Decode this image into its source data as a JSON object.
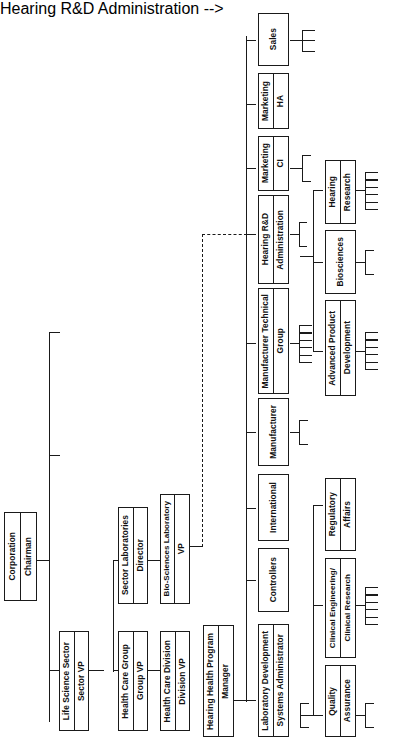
{
  "diagram": {
    "orientation": "rotated-90-ccw",
    "line_color": "#1a1a1a",
    "box_fill": "#ffffff"
  },
  "nodes": {
    "corporation": {
      "line1": "Corporation",
      "line2": "Chairman"
    },
    "life_science": {
      "line1": "Life Science Sector",
      "line2": "Sector VP"
    },
    "health_care_group": {
      "line1": "Health Care Group",
      "line2": "Group VP"
    },
    "sector_labs": {
      "line1": "Sector Laboratories",
      "line2": "Director"
    },
    "health_care_div": {
      "line1": "Health Care Division",
      "line2": "Division VP"
    },
    "biosciences_lab": {
      "line1": "Bio-Sciences Laboratory",
      "line2": "VP"
    },
    "hearing_health": {
      "line1": "Hearing Health Program",
      "line2": "Manager"
    },
    "lab_dev": {
      "line1": "Laboratory Development",
      "line2": "Systems Administrator"
    },
    "controllers": {
      "line1": "Controllers",
      "line2": ""
    },
    "international": {
      "line1": "International",
      "line2": ""
    },
    "manufacturer": {
      "line1": "Manufacturer",
      "line2": ""
    },
    "mfg_tech_group": {
      "line1": "Manufacturer Technical",
      "line2": "Group"
    },
    "hearing_rd": {
      "line1": "Hearing R&D",
      "line2": "Administration"
    },
    "marketing_ci": {
      "line1": "Marketing",
      "line2": "CI"
    },
    "marketing_ha": {
      "line1": "Marketing",
      "line2": "HA"
    },
    "sales": {
      "line1": "Sales",
      "line2": ""
    },
    "quality_assurance": {
      "line1": "Quality",
      "line2": "Assurance"
    },
    "clinical_eng": {
      "line1": "Clinical Engineering/",
      "line2": "Clinical Research"
    },
    "regulatory_affairs": {
      "line1": "Regulatory",
      "line2": "Affairs"
    },
    "advanced_product": {
      "line1": "Advanced Product",
      "line2": "Development"
    },
    "biosciences": {
      "line1": "Biosciences",
      "line2": ""
    },
    "hearing_research": {
      "line1": "Hearing",
      "line2": "Research"
    }
  },
  "leaf_groups": {
    "sales_leaves": {
      "count": 3,
      "label": "unlabeled sub-units of Sales"
    },
    "marketing_ci_leaves": {
      "count": 2,
      "label": "unlabeled sub-units of Marketing CI"
    },
    "hearing_research_leaves": {
      "count": 6,
      "label": "unlabeled sub-units of Hearing Research"
    },
    "biosciences_leaves": {
      "count": 2,
      "label": "unlabeled sub-units of Biosciences"
    },
    "advanced_product_leaves": {
      "count": 6,
      "label": "unlabeled sub-units of Advanced Product Development"
    },
    "mfg_tech_leaves": {
      "count": 6,
      "label": "unlabeled sub-units of Manufacturer Technical Group"
    },
    "manufacturer_leaves": {
      "count": 2,
      "label": "unlabeled sub-units of Manufacturer"
    },
    "hearing_rd_leaves": {
      "count": 2,
      "label": "unlabeled sub-units of Hearing R&D Administration"
    },
    "clinical_eng_leaves": {
      "count": 6,
      "label": "unlabeled sub-units of Clinical Engineering / Clinical Research"
    },
    "quality_assurance_leaves": {
      "count": 2,
      "label": "unlabeled sub-units of Quality Assurance"
    },
    "lab_dev_leaves": {
      "count": 2,
      "label": "unlabeled sub-units of Laboratory Development"
    }
  },
  "hierarchy": {
    "root": "corporation",
    "edges": [
      {
        "parent": "corporation",
        "child": "life_science"
      },
      {
        "parent": "life_science",
        "child": "health_care_group"
      },
      {
        "parent": "health_care_group",
        "child": "sector_labs"
      },
      {
        "parent": "health_care_group",
        "child": "health_care_div"
      },
      {
        "parent": "sector_labs",
        "child": "biosciences_lab"
      },
      {
        "parent": "health_care_div",
        "child": "hearing_health"
      },
      {
        "parent": "hearing_health",
        "child": "lab_dev"
      },
      {
        "parent": "hearing_health",
        "child": "controllers"
      },
      {
        "parent": "hearing_health",
        "child": "international"
      },
      {
        "parent": "hearing_health",
        "child": "manufacturer"
      },
      {
        "parent": "hearing_health",
        "child": "mfg_tech_group"
      },
      {
        "parent": "hearing_health",
        "child": "hearing_rd"
      },
      {
        "parent": "hearing_health",
        "child": "marketing_ci"
      },
      {
        "parent": "hearing_health",
        "child": "marketing_ha"
      },
      {
        "parent": "hearing_health",
        "child": "sales"
      },
      {
        "parent": "lab_dev",
        "child": "quality_assurance"
      },
      {
        "parent": "lab_dev",
        "child": "clinical_eng"
      },
      {
        "parent": "lab_dev",
        "child": "regulatory_affairs"
      },
      {
        "parent": "hearing_rd",
        "child": "advanced_product"
      },
      {
        "parent": "hearing_rd",
        "child": "biosciences"
      },
      {
        "parent": "hearing_rd",
        "child": "hearing_research"
      }
    ],
    "dashed_edge": {
      "from": "biosciences_lab",
      "to": "hearing_rd",
      "style": "dashed",
      "meaning": "dotted-line reporting"
    }
  }
}
